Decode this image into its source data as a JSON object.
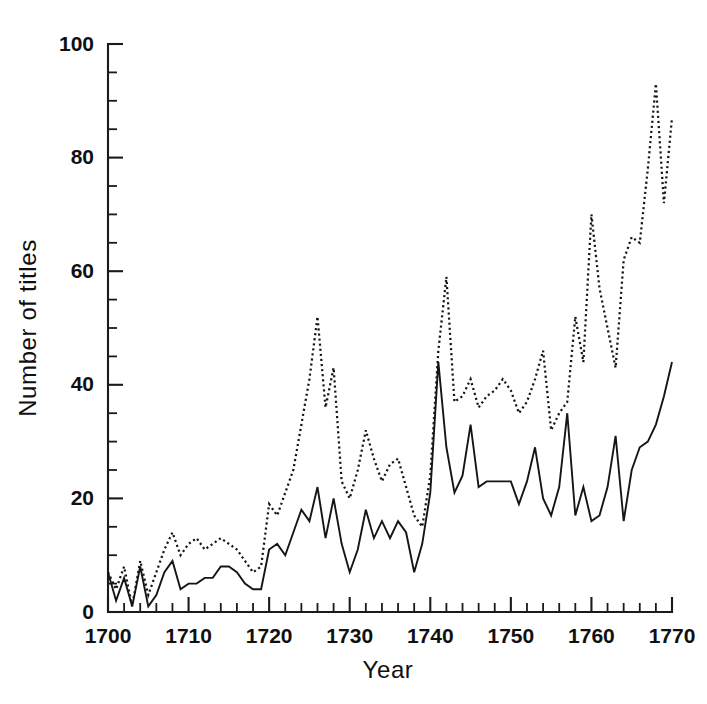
{
  "chart_data": {
    "type": "line",
    "title": "",
    "xlabel": "Year",
    "ylabel": "Number of titles",
    "xlim": [
      1700,
      1770
    ],
    "ylim": [
      0,
      100
    ],
    "grid": false,
    "legend_position": "none",
    "x_major_ticks": [
      1700,
      1710,
      1720,
      1730,
      1740,
      1750,
      1760,
      1770
    ],
    "x_tick_labels": [
      "1700",
      "1710",
      "1720",
      "1730",
      "1740",
      "1750",
      "1760",
      "1770"
    ],
    "x_minor_tick_step": 2,
    "y_major_ticks": [
      0,
      20,
      40,
      60,
      80,
      100
    ],
    "y_tick_labels": [
      "0",
      "20",
      "40",
      "60",
      "80",
      "100"
    ],
    "y_minor_tick_step": 5,
    "x": [
      1700,
      1701,
      1702,
      1703,
      1704,
      1705,
      1706,
      1707,
      1708,
      1709,
      1710,
      1711,
      1712,
      1713,
      1714,
      1715,
      1716,
      1717,
      1718,
      1719,
      1720,
      1721,
      1722,
      1723,
      1724,
      1725,
      1726,
      1727,
      1728,
      1729,
      1730,
      1731,
      1732,
      1733,
      1734,
      1735,
      1736,
      1737,
      1738,
      1739,
      1740,
      1741,
      1742,
      1743,
      1744,
      1745,
      1746,
      1747,
      1748,
      1749,
      1750,
      1751,
      1752,
      1753,
      1754,
      1755,
      1756,
      1757,
      1758,
      1759,
      1760,
      1761,
      1762,
      1763,
      1764,
      1765,
      1766,
      1767,
      1768,
      1769,
      1770
    ],
    "series": [
      {
        "name": "upper-dotted-series",
        "style": "dotted",
        "values": [
          7,
          4,
          8,
          1,
          9,
          3,
          7,
          11,
          14,
          10,
          12,
          13,
          11,
          12,
          13,
          12,
          11,
          9,
          7,
          8,
          19,
          17,
          21,
          25,
          33,
          41,
          52,
          36,
          43,
          23,
          20,
          25,
          32,
          27,
          23,
          26,
          27,
          22,
          17,
          15,
          24,
          46,
          59,
          37,
          38,
          41,
          36,
          38,
          39,
          41,
          39,
          35,
          37,
          41,
          46,
          32,
          35,
          37,
          52,
          44,
          70,
          57,
          50,
          43,
          62,
          66,
          65,
          78,
          93,
          72,
          87
        ]
      },
      {
        "name": "lower-solid-series",
        "style": "solid",
        "values": [
          7,
          2,
          6,
          1,
          8,
          1,
          3,
          7,
          9,
          4,
          5,
          5,
          6,
          6,
          8,
          8,
          7,
          5,
          4,
          4,
          11,
          12,
          10,
          14,
          18,
          16,
          22,
          13,
          20,
          12,
          7,
          11,
          18,
          13,
          16,
          13,
          16,
          14,
          7,
          12,
          21,
          44,
          29,
          21,
          24,
          33,
          22,
          23,
          23,
          23,
          23,
          19,
          23,
          29,
          20,
          17,
          22,
          35,
          17,
          22,
          16,
          17,
          22,
          31,
          16,
          25,
          29,
          30,
          33,
          38,
          44
        ]
      }
    ]
  }
}
